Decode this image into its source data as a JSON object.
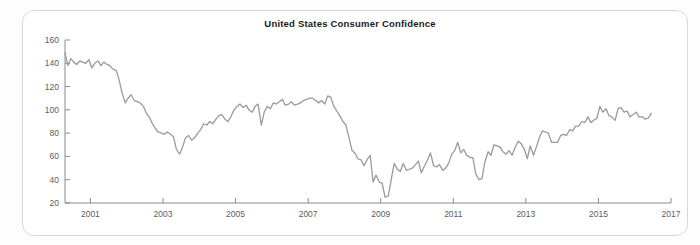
{
  "frame": {
    "border_color": "#d8d8d8",
    "background": "#ffffff"
  },
  "credit": {
    "text": "Based on data from The Conference Board"
  },
  "chart_data": {
    "type": "line",
    "title": "United States Consumer Confidence",
    "subtitle": "",
    "xlabel": "",
    "ylabel": "",
    "source_note": "Based on data from The Conference Board",
    "line_color": "#9a9a9a",
    "axis_color": "#808080",
    "grid": false,
    "legend": null,
    "xlim": [
      2000.3,
      2017.0
    ],
    "ylim": [
      20,
      160
    ],
    "yticks": [
      20,
      40,
      60,
      80,
      100,
      120,
      140,
      160
    ],
    "ytick_labels": [
      "20",
      "40",
      "60",
      "80",
      "100",
      "120",
      "140",
      "160"
    ],
    "xticks": [
      2001,
      2003,
      2005,
      2007,
      2009,
      2011,
      2013,
      2015,
      2017
    ],
    "xtick_labels": [
      "2001",
      "2003",
      "2005",
      "2007",
      "2009",
      "2011",
      "2013",
      "2015",
      "2017"
    ],
    "series": [
      {
        "name": "Consumer Confidence Index",
        "x": [
          2000.3,
          2000.38,
          2000.46,
          2000.54,
          2000.62,
          2000.71,
          2000.79,
          2000.87,
          2000.96,
          2001.04,
          2001.12,
          2001.21,
          2001.29,
          2001.37,
          2001.46,
          2001.54,
          2001.62,
          2001.71,
          2001.79,
          2001.87,
          2001.96,
          2002.04,
          2002.12,
          2002.21,
          2002.29,
          2002.37,
          2002.46,
          2002.54,
          2002.62,
          2002.71,
          2002.79,
          2002.87,
          2002.96,
          2003.04,
          2003.12,
          2003.21,
          2003.29,
          2003.37,
          2003.46,
          2003.54,
          2003.62,
          2003.71,
          2003.79,
          2003.87,
          2003.96,
          2004.04,
          2004.12,
          2004.21,
          2004.29,
          2004.37,
          2004.46,
          2004.54,
          2004.62,
          2004.71,
          2004.79,
          2004.87,
          2004.96,
          2005.04,
          2005.12,
          2005.21,
          2005.29,
          2005.37,
          2005.46,
          2005.54,
          2005.62,
          2005.71,
          2005.79,
          2005.87,
          2005.96,
          2006.04,
          2006.12,
          2006.21,
          2006.29,
          2006.37,
          2006.46,
          2006.54,
          2006.62,
          2006.71,
          2006.79,
          2006.87,
          2006.96,
          2007.04,
          2007.12,
          2007.21,
          2007.29,
          2007.37,
          2007.46,
          2007.54,
          2007.62,
          2007.71,
          2007.79,
          2007.87,
          2007.96,
          2008.04,
          2008.12,
          2008.21,
          2008.29,
          2008.37,
          2008.46,
          2008.54,
          2008.62,
          2008.71,
          2008.79,
          2008.87,
          2008.96,
          2009.04,
          2009.12,
          2009.21,
          2009.29,
          2009.37,
          2009.46,
          2009.54,
          2009.62,
          2009.71,
          2009.79,
          2009.87,
          2009.96,
          2010.04,
          2010.12,
          2010.21,
          2010.29,
          2010.37,
          2010.46,
          2010.54,
          2010.62,
          2010.71,
          2010.79,
          2010.87,
          2010.96,
          2011.04,
          2011.12,
          2011.21,
          2011.29,
          2011.37,
          2011.46,
          2011.54,
          2011.62,
          2011.71,
          2011.79,
          2011.87,
          2011.96,
          2012.04,
          2012.12,
          2012.21,
          2012.29,
          2012.37,
          2012.46,
          2012.54,
          2012.62,
          2012.71,
          2012.79,
          2012.87,
          2012.96,
          2013.04,
          2013.12,
          2013.21,
          2013.29,
          2013.37,
          2013.46,
          2013.54,
          2013.62,
          2013.71,
          2013.79,
          2013.87,
          2013.96,
          2014.04,
          2014.12,
          2014.21,
          2014.29,
          2014.37,
          2014.46,
          2014.54,
          2014.62,
          2014.71,
          2014.79,
          2014.87,
          2014.96,
          2015.04,
          2015.12,
          2015.21,
          2015.29,
          2015.37,
          2015.46,
          2015.54,
          2015.62,
          2015.71,
          2015.79,
          2015.87,
          2015.96,
          2016.04,
          2016.12,
          2016.21,
          2016.29,
          2016.37,
          2016.46
        ],
        "values": [
          149,
          138,
          144,
          141,
          139,
          142,
          141,
          140,
          143,
          136,
          140,
          142,
          138,
          141,
          139,
          138,
          135,
          134,
          126,
          115,
          106,
          110,
          113,
          108,
          107,
          106,
          103,
          97,
          94,
          88,
          84,
          81,
          80,
          79,
          81,
          79,
          77,
          66,
          62,
          68,
          76,
          78,
          74,
          76,
          80,
          83,
          88,
          87,
          90,
          88,
          92,
          95,
          96,
          92,
          90,
          94,
          100,
          103,
          105,
          102,
          104,
          100,
          98,
          103,
          105,
          87,
          98,
          103,
          101,
          106,
          105,
          107,
          109,
          104,
          105,
          107,
          104,
          105,
          106,
          108,
          109,
          110,
          110,
          108,
          106,
          108,
          105,
          112,
          111,
          103,
          99,
          95,
          90,
          87,
          77,
          65,
          63,
          58,
          57,
          52,
          57,
          61,
          38,
          44,
          38,
          37,
          25,
          26,
          40,
          54,
          49,
          47,
          54,
          48,
          49,
          50,
          53,
          56,
          46,
          52,
          57,
          63,
          52,
          51,
          53,
          48,
          50,
          54,
          62,
          65,
          72,
          63,
          66,
          61,
          59,
          59,
          45,
          40,
          41,
          55,
          64,
          61,
          70,
          69,
          68,
          64,
          62,
          65,
          61,
          68,
          73,
          71,
          66,
          58,
          69,
          61,
          68,
          76,
          82,
          81,
          80,
          72,
          72,
          72,
          78,
          79,
          78,
          83,
          82,
          86,
          86,
          90,
          89,
          94,
          89,
          91,
          93,
          103,
          98,
          101,
          95,
          94,
          91,
          101,
          102,
          98,
          99,
          94,
          96,
          98,
          94,
          94,
          92,
          93,
          97
        ]
      }
    ]
  }
}
